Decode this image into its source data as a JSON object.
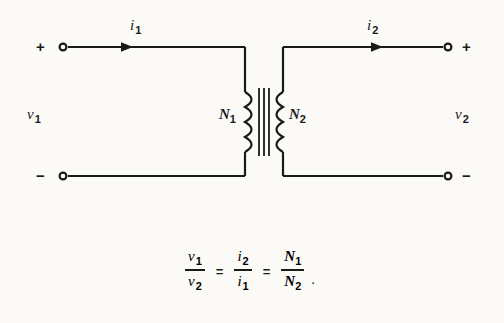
{
  "figure": {
    "type": "ideal-transformer-circuit-diagram",
    "background_color": "#fbfaf7",
    "line_color": "#1a1a1a"
  },
  "terminals": {
    "left_top_sign": "+",
    "left_bottom_sign": "−",
    "right_top_sign": "+",
    "right_bottom_sign": "−"
  },
  "labels": {
    "current_primary": {
      "symbol": "i",
      "subscript": "1"
    },
    "current_secondary": {
      "symbol": "i",
      "subscript": "2"
    },
    "voltage_primary": {
      "symbol": "v",
      "subscript": "1"
    },
    "voltage_secondary": {
      "symbol": "v",
      "subscript": "2"
    },
    "turns_primary": {
      "symbol": "N",
      "subscript": "1"
    },
    "turns_secondary": {
      "symbol": "N",
      "subscript": "2"
    }
  },
  "equation": {
    "terms": [
      {
        "num_symbol": "v",
        "num_sub": "1",
        "den_symbol": "v",
        "den_sub": "2"
      },
      {
        "num_symbol": "i",
        "num_sub": "2",
        "den_symbol": "i",
        "den_sub": "1"
      },
      {
        "num_symbol": "N",
        "num_sub": "1",
        "den_symbol": "N",
        "den_sub": "2"
      }
    ],
    "operator": "=",
    "trailing_punctuation": "."
  }
}
